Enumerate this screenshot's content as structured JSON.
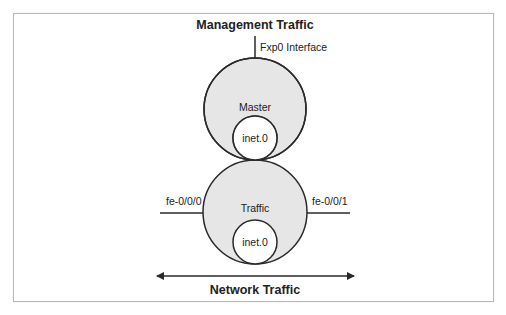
{
  "diagram": {
    "title_top": "Management Traffic",
    "title_bottom": "Network Traffic",
    "management_interface_label": "Fxp0 Interface",
    "master_instance": {
      "label": "Master",
      "routing_table": "inet.0"
    },
    "traffic_instance": {
      "label": "Traffic",
      "routing_table": "inet.0"
    },
    "left_interface_label": "fe-0/0/0",
    "right_interface_label": "fe-0/0/1",
    "colors": {
      "circle_fill": "#e6e6e6",
      "stroke": "#2a2a2a",
      "frame_border": "#b8b8b8",
      "inner_fill": "#ffffff"
    }
  }
}
